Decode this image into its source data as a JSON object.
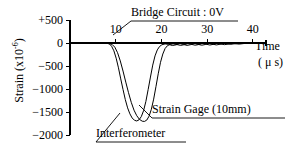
{
  "chart_data": {
    "type": "line",
    "title": "",
    "xlabel": "Time",
    "xunits": "( μ s)",
    "ylabel": "Strain",
    "yunits": "(x10",
    "yunits_exp": "-6",
    "yunits_close": ")",
    "xlim": [
      0,
      42
    ],
    "ylim": [
      -2000,
      500
    ],
    "grid": false,
    "legend_position": "inline-annotations",
    "xticks": [
      10,
      20,
      30,
      40
    ],
    "xtick_labels": [
      "10",
      "20",
      "30",
      "40"
    ],
    "yticks": [
      500,
      0,
      -500,
      -1000,
      -1500,
      -2000
    ],
    "ytick_labels": [
      "+500",
      "0",
      "−500",
      "−1000",
      "−1500",
      "−2000"
    ],
    "annotations": [
      {
        "name": "bridge-circuit",
        "text": "Bridge Circuit : 0V"
      },
      {
        "name": "strain-gage",
        "text": "Strain Gage (10mm)"
      },
      {
        "name": "interferometer",
        "text": "Interferometer"
      }
    ],
    "series": [
      {
        "name": "Interferometer",
        "color": "#000000",
        "points": [
          [
            0,
            0
          ],
          [
            2,
            0
          ],
          [
            4,
            0
          ],
          [
            6,
            0
          ],
          [
            7,
            -2
          ],
          [
            8,
            -6
          ],
          [
            8.6,
            -20
          ],
          [
            9.1,
            -70
          ],
          [
            9.6,
            -170
          ],
          [
            10.1,
            -330
          ],
          [
            10.6,
            -540
          ],
          [
            11.1,
            -780
          ],
          [
            11.6,
            -1010
          ],
          [
            12.1,
            -1230
          ],
          [
            12.6,
            -1410
          ],
          [
            13.1,
            -1540
          ],
          [
            13.6,
            -1630
          ],
          [
            14.1,
            -1680
          ],
          [
            14.6,
            -1695
          ],
          [
            15.1,
            -1670
          ],
          [
            15.6,
            -1600
          ],
          [
            16.1,
            -1470
          ],
          [
            16.6,
            -1270
          ],
          [
            17.1,
            -1010
          ],
          [
            17.6,
            -740
          ],
          [
            18.1,
            -480
          ],
          [
            18.6,
            -280
          ],
          [
            19.1,
            -150
          ],
          [
            19.6,
            -75
          ],
          [
            20.1,
            -38
          ],
          [
            20.8,
            -20
          ],
          [
            21.6,
            -30
          ],
          [
            22.4,
            -55
          ],
          [
            23.2,
            -40
          ],
          [
            24.0,
            -12
          ],
          [
            24.8,
            -30
          ],
          [
            25.6,
            -52
          ],
          [
            26.4,
            -36
          ],
          [
            27.2,
            -10
          ],
          [
            28.0,
            -28
          ],
          [
            28.8,
            -48
          ],
          [
            29.6,
            -33
          ],
          [
            30.4,
            -9
          ],
          [
            31.2,
            -25
          ],
          [
            32.0,
            -42
          ],
          [
            32.8,
            -28
          ],
          [
            33.6,
            -8
          ],
          [
            34.4,
            -18
          ],
          [
            35.2,
            -28
          ],
          [
            36.0,
            -16
          ],
          [
            37.0,
            -6
          ],
          [
            38.0,
            -8
          ],
          [
            39.0,
            -4
          ],
          [
            40.0,
            -2
          ],
          [
            41.0,
            0
          ]
        ]
      },
      {
        "name": "Strain Gage (10mm)",
        "color": "#000000",
        "points": [
          [
            0,
            0
          ],
          [
            2,
            0
          ],
          [
            4,
            0
          ],
          [
            6,
            0
          ],
          [
            7.4,
            -2
          ],
          [
            8.4,
            -8
          ],
          [
            9.2,
            -30
          ],
          [
            9.8,
            -90
          ],
          [
            10.4,
            -210
          ],
          [
            11.0,
            -390
          ],
          [
            11.6,
            -610
          ],
          [
            12.2,
            -850
          ],
          [
            12.8,
            -1080
          ],
          [
            13.4,
            -1290
          ],
          [
            14.0,
            -1460
          ],
          [
            14.6,
            -1580
          ],
          [
            15.2,
            -1660
          ],
          [
            15.8,
            -1700
          ],
          [
            16.3,
            -1705
          ],
          [
            16.8,
            -1675
          ],
          [
            17.3,
            -1590
          ],
          [
            17.8,
            -1440
          ],
          [
            18.3,
            -1220
          ],
          [
            18.8,
            -950
          ],
          [
            19.3,
            -670
          ],
          [
            19.8,
            -420
          ],
          [
            20.3,
            -240
          ],
          [
            20.8,
            -120
          ],
          [
            21.3,
            -60
          ],
          [
            21.9,
            -30
          ],
          [
            22.6,
            -18
          ],
          [
            23.4,
            -34
          ],
          [
            24.2,
            -52
          ],
          [
            25.0,
            -36
          ],
          [
            25.8,
            -12
          ],
          [
            26.6,
            -30
          ],
          [
            27.4,
            -48
          ],
          [
            28.2,
            -32
          ],
          [
            29.0,
            -10
          ],
          [
            29.8,
            -26
          ],
          [
            30.6,
            -44
          ],
          [
            31.4,
            -28
          ],
          [
            32.2,
            -9
          ],
          [
            33.0,
            -22
          ],
          [
            33.8,
            -36
          ],
          [
            34.6,
            -22
          ],
          [
            35.4,
            -7
          ],
          [
            36.2,
            -16
          ],
          [
            37.0,
            -24
          ],
          [
            38.0,
            -12
          ],
          [
            39.0,
            -6
          ],
          [
            40.0,
            -3
          ],
          [
            41.0,
            0
          ]
        ]
      }
    ]
  }
}
